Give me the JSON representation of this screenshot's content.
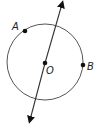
{
  "diagram": {
    "title": "",
    "circle": {
      "center_label": "O",
      "cx": 45,
      "cy": 62,
      "r": 38,
      "stroke": "#555555"
    },
    "points": [
      {
        "label": "A",
        "x": 25,
        "y": 31
      },
      {
        "label": "B",
        "x": 83,
        "y": 65
      },
      {
        "label": "O",
        "x": 45,
        "y": 63
      }
    ],
    "line": {
      "x1": 30,
      "y1": 118,
      "x2": 62,
      "y2": 6,
      "label": "",
      "arrows": "both"
    },
    "colors": {
      "stroke": "#555555",
      "point": "#111111",
      "text": "#222222"
    }
  }
}
